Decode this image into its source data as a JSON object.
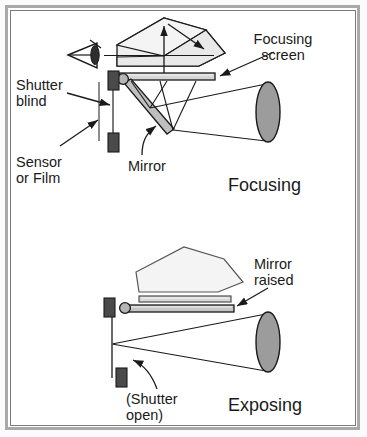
{
  "diagram": {
    "frame": {
      "outer_border_color": "#a9a9a9",
      "inner_border_color": "#7a7a7a",
      "background": "#ffffff"
    },
    "colors": {
      "line": "#1a1a1a",
      "prism_fill": "#f2f2f2",
      "prism_fill_shaded": "#e8e8e8",
      "screen_fill": "#d4d4d4",
      "mirror_fill": "#bdbdbd",
      "lens_fill": "#9a9a9a",
      "shutter_fill": "#4a4a4a",
      "pivot_fill": "#b0b0b0",
      "text": "#1a1a1a"
    },
    "panels": [
      {
        "id": "focusing",
        "state_label": "Focusing",
        "labels": [
          {
            "id": "focusing-screen",
            "text_lines": [
              "Focusing",
              "screen"
            ],
            "anchor": "end"
          },
          {
            "id": "shutter-blind",
            "text_lines": [
              "Shutter",
              "blind"
            ],
            "anchor": "start"
          },
          {
            "id": "sensor-or-film",
            "text_lines": [
              "Sensor",
              "or Film"
            ],
            "anchor": "start"
          },
          {
            "id": "mirror",
            "text_lines": [
              "Mirror"
            ],
            "anchor": "start"
          }
        ],
        "components": [
          "pentaprism",
          "eyepiece-eye",
          "focusing-screen-bar",
          "mirror-down",
          "mirror-pivot",
          "shutter-blind-closed",
          "sensor-film-plane",
          "lens",
          "light-rays"
        ]
      },
      {
        "id": "exposing",
        "state_label": "Exposing",
        "labels": [
          {
            "id": "mirror-raised",
            "text_lines": [
              "Mirror",
              "raised"
            ],
            "anchor": "start"
          },
          {
            "id": "shutter-open",
            "text_lines": [
              "(Shutter",
              "open)"
            ],
            "anchor": "start"
          }
        ],
        "components": [
          "pentaprism",
          "focusing-screen-bar",
          "mirror-raised-bar",
          "mirror-pivot",
          "shutter-blind-open",
          "sensor-film-plane",
          "lens",
          "light-rays"
        ]
      }
    ]
  }
}
